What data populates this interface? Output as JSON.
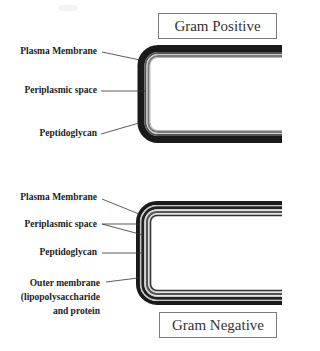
{
  "gram_positive": {
    "title": "Gram Positive",
    "labels": {
      "plasma_membrane": "Plasma Membrane",
      "periplasmic_space": "Periplasmic space",
      "peptidoglycan": "Peptidoglycan"
    }
  },
  "gram_negative": {
    "title": "Gram Negative",
    "labels": {
      "plasma_membrane": "Plasma Membrane",
      "periplasmic_space": "Periplasmic space",
      "peptidoglycan": "Peptidoglycan",
      "outer_membrane_line1": "Outer membrane",
      "outer_membrane_line2": "(lipopolysaccharide",
      "outer_membrane_line3": "and protein"
    }
  },
  "colors": {
    "wall_dark": "#1a1a1a",
    "wall_gray": "#6a6a6a",
    "wall_light": "#c8c8c8",
    "leader_line": "#333333",
    "box_border": "#7a7a7a"
  }
}
